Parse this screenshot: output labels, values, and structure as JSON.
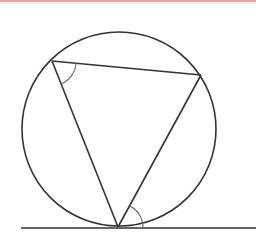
{
  "diagram": {
    "type": "circle-geometry",
    "colors": {
      "stroke": "#333333",
      "arc": "#666666",
      "top_border": "#f2a0a0",
      "background": "#ffffff"
    },
    "circle": {
      "cx": 119,
      "cy": 129,
      "r": 97
    },
    "triangle": {
      "vertices": [
        {
          "name": "top-left",
          "x": 52,
          "y": 61
        },
        {
          "name": "top-right",
          "x": 201,
          "y": 75
        },
        {
          "name": "bottom",
          "x": 118,
          "y": 227
        }
      ]
    },
    "tangent_line": {
      "x1": 21,
      "y1": 228,
      "x2": 256,
      "y2": 228
    },
    "angle_marks": [
      {
        "at": "top-left",
        "between": [
          "top-right",
          "bottom"
        ]
      },
      {
        "at": "bottom",
        "between": [
          "top-right",
          "tangent-right"
        ]
      }
    ]
  }
}
